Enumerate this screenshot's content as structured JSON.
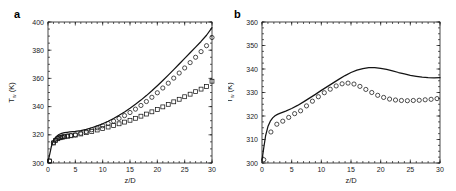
{
  "figure": {
    "panels": [
      {
        "label": "a",
        "name": "panel-a"
      },
      {
        "label": "b",
        "name": "panel-b"
      }
    ]
  },
  "chart_data": [
    {
      "type": "line",
      "panel": "a",
      "title": "",
      "xlabel": "z/D",
      "ylabel": "T_w (K)",
      "ylabel_main": "T",
      "ylabel_sub": "w",
      "ylabel_unit": "(K)",
      "xlim": [
        0,
        30
      ],
      "ylim": [
        300,
        400
      ],
      "xticks": [
        0,
        5,
        10,
        15,
        20,
        25,
        30
      ],
      "xticklabels": [
        "0",
        "5",
        "10",
        "15",
        "20",
        "25",
        "30"
      ],
      "yticks": [
        300,
        320,
        340,
        360,
        380,
        400
      ],
      "yticklabels": [
        "300",
        "320",
        "340",
        "360",
        "380",
        "400"
      ],
      "grid": false,
      "legend": "none",
      "series": [
        {
          "name": "simulation-line",
          "style": "solid-line",
          "x": [
            0.0,
            0.3,
            0.6,
            0.9,
            1.2,
            1.6,
            2.0,
            2.5,
            3.0,
            3.5,
            4.0,
            5.0,
            6.0,
            7.0,
            8.0,
            9.0,
            10.0,
            11.0,
            12.0,
            13.0,
            14.0,
            15.0,
            16.0,
            17.0,
            18.0,
            19.0,
            20.0,
            21.0,
            22.0,
            23.0,
            24.0,
            25.0,
            26.0,
            27.0,
            28.0,
            29.0,
            30.0
          ],
          "y": [
            301.2,
            306.0,
            311.5,
            315.0,
            317.3,
            319.0,
            320.2,
            321.0,
            321.5,
            321.8,
            322.0,
            322.4,
            323.0,
            323.9,
            325.0,
            326.3,
            327.8,
            329.6,
            331.6,
            333.8,
            336.2,
            338.8,
            341.6,
            344.6,
            347.8,
            351.2,
            354.8,
            358.5,
            362.3,
            366.2,
            370.2,
            374.2,
            378.2,
            382.2,
            386.2,
            390.6,
            396.0
          ]
        },
        {
          "name": "experiment-circles",
          "style": "open-circle",
          "x": [
            0.3,
            1.0,
            1.4,
            1.8,
            2.2,
            2.6,
            3.0,
            3.6,
            4.2,
            5.0,
            6.0,
            7.0,
            8.0,
            9.0,
            10.0,
            11.0,
            12.0,
            13.0,
            14.0,
            15.0,
            16.0,
            17.0,
            18.0,
            19.0,
            20.0,
            21.0,
            22.0,
            23.0,
            24.0,
            25.0,
            26.0,
            27.0,
            28.0,
            29.0,
            30.0
          ],
          "y": [
            301.4,
            314.5,
            316.3,
            317.4,
            318.1,
            318.5,
            318.8,
            319.2,
            319.5,
            320.0,
            321.1,
            322.3,
            323.6,
            325.0,
            326.4,
            328.0,
            329.7,
            331.6,
            333.6,
            335.8,
            338.2,
            340.8,
            343.6,
            346.6,
            349.8,
            353.2,
            356.6,
            360.2,
            363.8,
            367.4,
            371.2,
            375.0,
            379.0,
            383.2,
            389.0
          ]
        },
        {
          "name": "experiment-squares",
          "style": "open-square",
          "x": [
            0.3,
            1.0,
            1.4,
            1.8,
            2.2,
            2.6,
            3.0,
            3.6,
            4.2,
            5.0,
            6.0,
            7.0,
            8.0,
            9.0,
            10.0,
            11.0,
            12.0,
            13.0,
            14.0,
            15.0,
            16.0,
            17.0,
            18.0,
            19.0,
            20.0,
            21.0,
            22.0,
            23.0,
            24.0,
            25.0,
            26.0,
            27.0,
            28.0,
            29.0,
            30.0
          ],
          "y": [
            301.4,
            314.2,
            316.0,
            317.2,
            317.9,
            318.3,
            318.6,
            319.0,
            319.3,
            319.8,
            320.6,
            321.5,
            322.4,
            323.4,
            324.4,
            325.5,
            326.6,
            327.8,
            329.0,
            330.3,
            331.7,
            333.2,
            334.7,
            336.3,
            338.0,
            339.8,
            341.6,
            343.4,
            345.2,
            347.0,
            348.8,
            350.6,
            352.4,
            354.3,
            358.0
          ]
        }
      ]
    },
    {
      "type": "line",
      "panel": "b",
      "title": "",
      "xlabel": "z/D",
      "ylabel": "T_w (K)",
      "ylabel_main": "T",
      "ylabel_sub": "w",
      "ylabel_unit": "(K)",
      "xlim": [
        0,
        30
      ],
      "ylim": [
        300,
        360
      ],
      "xticks": [
        0,
        5,
        10,
        15,
        20,
        25,
        30
      ],
      "xticklabels": [
        "0",
        "5",
        "10",
        "15",
        "20",
        "25",
        "30"
      ],
      "yticks": [
        300,
        310,
        320,
        330,
        340,
        350,
        360
      ],
      "yticklabels": [
        "300",
        "310",
        "320",
        "330",
        "340",
        "350",
        "360"
      ],
      "grid": false,
      "legend": "none",
      "series": [
        {
          "name": "simulation-line",
          "style": "solid-line",
          "x": [
            0.0,
            0.3,
            0.6,
            1.0,
            1.4,
            1.8,
            2.2,
            2.6,
            3.0,
            4.0,
            5.0,
            6.0,
            7.0,
            8.0,
            9.0,
            10.0,
            11.0,
            12.0,
            13.0,
            14.0,
            15.0,
            16.0,
            17.0,
            18.0,
            19.0,
            20.0,
            21.0,
            22.0,
            23.0,
            24.0,
            25.0,
            26.0,
            27.0,
            28.0,
            29.0,
            30.0
          ],
          "y": [
            301.2,
            306.5,
            311.5,
            315.5,
            317.8,
            319.2,
            320.1,
            320.7,
            321.1,
            322.1,
            323.2,
            324.5,
            326.0,
            327.6,
            329.2,
            330.9,
            332.5,
            334.1,
            335.7,
            337.2,
            338.5,
            339.5,
            340.2,
            340.6,
            340.6,
            340.3,
            339.8,
            339.2,
            338.5,
            337.9,
            337.3,
            336.9,
            336.5,
            336.3,
            336.2,
            336.3
          ]
        },
        {
          "name": "experiment-circles",
          "style": "open-circle",
          "x": [
            0.3,
            1.5,
            2.5,
            3.5,
            4.5,
            5.5,
            6.5,
            7.5,
            8.5,
            9.5,
            10.5,
            11.5,
            12.5,
            13.5,
            14.5,
            15.5,
            16.5,
            17.5,
            18.5,
            19.5,
            20.5,
            21.5,
            22.5,
            23.5,
            24.5,
            25.5,
            26.5,
            27.5,
            28.5,
            29.5
          ],
          "y": [
            301.4,
            313.2,
            316.5,
            317.8,
            319.4,
            321.0,
            322.2,
            324.3,
            326.3,
            328.2,
            329.9,
            331.4,
            332.8,
            333.7,
            334.0,
            333.6,
            332.6,
            331.3,
            330.0,
            328.8,
            327.9,
            327.2,
            326.8,
            326.6,
            326.5,
            326.6,
            326.7,
            326.9,
            327.1,
            327.4
          ]
        }
      ]
    }
  ]
}
